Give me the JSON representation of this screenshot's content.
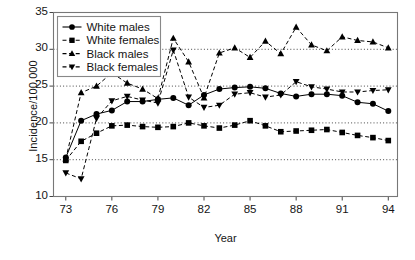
{
  "chart_data": {
    "type": "line",
    "title": "",
    "xlabel": "Year",
    "ylabel": "Incidence/100,000",
    "xlim": [
      72.2,
      94.6
    ],
    "ylim": [
      10,
      35
    ],
    "xticks": [
      "73",
      "76",
      "79",
      "82",
      "85",
      "88",
      "91",
      "94"
    ],
    "xtick_values": [
      73,
      76,
      79,
      82,
      85,
      88,
      91,
      94
    ],
    "yticks": [
      "10",
      "15",
      "20",
      "25",
      "30",
      "35"
    ],
    "ytick_values": [
      10,
      15,
      20,
      25,
      30,
      35
    ],
    "gridlines": [
      15,
      20,
      25,
      30
    ],
    "grid": "horizontal-dotted",
    "legend_position": "top-left-inside",
    "x": [
      73,
      74,
      75,
      76,
      77,
      78,
      79,
      80,
      81,
      82,
      83,
      84,
      85,
      86,
      87,
      88,
      89,
      90,
      91,
      92,
      93,
      94
    ],
    "series": [
      {
        "name": "White males",
        "marker": "circle",
        "line": "solid",
        "color": "#000000",
        "values": [
          15.3,
          20.3,
          21.2,
          21.7,
          22.9,
          22.9,
          23.2,
          23.4,
          22.4,
          23.8,
          24.6,
          24.8,
          24.9,
          24.7,
          24.0,
          23.6,
          23.9,
          23.9,
          23.7,
          22.8,
          22.6,
          21.6
        ]
      },
      {
        "name": "White females",
        "marker": "square",
        "line": "dashed",
        "color": "#000000",
        "values": [
          14.9,
          17.5,
          18.6,
          19.6,
          19.7,
          19.5,
          19.4,
          19.5,
          20.0,
          19.6,
          19.3,
          19.7,
          20.3,
          19.6,
          18.8,
          18.9,
          19.0,
          19.1,
          18.7,
          18.3,
          18.0,
          17.6
        ]
      },
      {
        "name": "Black males",
        "marker": "triangle-up",
        "line": "dashed",
        "color": "#000000",
        "values": [
          15.1,
          24.1,
          25.0,
          26.8,
          25.4,
          24.6,
          23.3,
          31.5,
          28.3,
          23.4,
          29.5,
          30.2,
          28.9,
          31.1,
          29.4,
          33.0,
          30.6,
          29.8,
          31.7,
          31.2,
          31.0,
          30.2
        ]
      },
      {
        "name": "Black females",
        "marker": "triangle-down",
        "line": "dashed",
        "color": "#000000",
        "values": [
          13.2,
          12.4,
          20.6,
          23.0,
          23.6,
          23.1,
          22.7,
          29.9,
          23.5,
          22.1,
          22.4,
          23.9,
          24.1,
          23.5,
          23.8,
          25.6,
          24.9,
          24.6,
          24.2,
          24.2,
          24.4,
          24.5
        ]
      }
    ]
  },
  "legend": {
    "entries": [
      {
        "label": "White males"
      },
      {
        "label": "White females"
      },
      {
        "label": "Black males"
      },
      {
        "label": "Black females"
      }
    ]
  }
}
